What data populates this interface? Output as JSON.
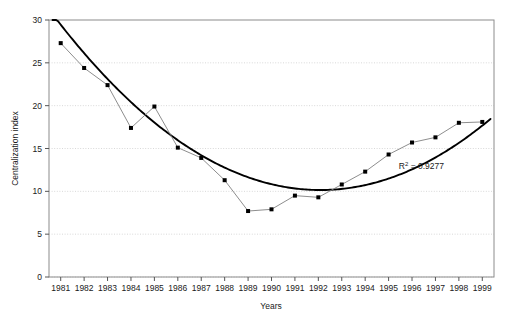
{
  "chart_data": {
    "type": "line",
    "title": "",
    "subtitle": "",
    "xlabel": "Years",
    "ylabel": "Centralization index",
    "categories": [
      "1981",
      "1982",
      "1983",
      "1984",
      "1985",
      "1986",
      "1987",
      "1988",
      "1989",
      "1990",
      "1991",
      "1992",
      "1993",
      "1994",
      "1995",
      "1996",
      "1997",
      "1998",
      "1999"
    ],
    "x": [
      1981,
      1982,
      1983,
      1984,
      1985,
      1986,
      1987,
      1988,
      1989,
      1990,
      1991,
      1992,
      1993,
      1994,
      1995,
      1996,
      1997,
      1998,
      1999
    ],
    "series": [
      {
        "name": "Centralization index",
        "values": [
          27.3,
          24.4,
          22.4,
          17.4,
          19.9,
          15.1,
          13.9,
          11.3,
          7.7,
          7.9,
          9.5,
          9.3,
          10.8,
          12.3,
          14.3,
          15.7,
          16.3,
          18.0,
          18.1
        ],
        "marker": "square",
        "marker_color": "#000000",
        "line_color": "#808080"
      },
      {
        "name": "Polynomial trendline",
        "type": "trendline",
        "trend_order": 2,
        "line_color": "#000000",
        "values": [
          28.5,
          25.7,
          23.1,
          20.7,
          18.5,
          16.6,
          14.9,
          13.4,
          12.2,
          11.2,
          10.4,
          9.9,
          9.6,
          9.6,
          10.5,
          11.7,
          13.4,
          15.9,
          19.6
        ]
      }
    ],
    "annotations": [
      {
        "text_prefix": "R",
        "text_sup": "2",
        "text_suffix": " = 0.9277",
        "value": 0.9277,
        "x": 1996.4,
        "y": 12.6
      }
    ],
    "xlim": [
      1980.5,
      1999.5
    ],
    "ylim": [
      0,
      30
    ],
    "yticks": [
      0,
      5,
      10,
      15,
      20,
      25,
      30
    ],
    "ytick_labels": [
      "0",
      "5",
      "10",
      "15",
      "20",
      "25",
      "30"
    ],
    "grid": {
      "horizontal": true,
      "vertical": false,
      "style": "dotted",
      "color": "#d8d8d8"
    },
    "legend": {
      "visible": false,
      "position": "none"
    },
    "frame": {
      "visible": true,
      "color": "#8c8c8c"
    }
  },
  "axes": {
    "y_title": "Centralization index",
    "x_title": "Years"
  }
}
